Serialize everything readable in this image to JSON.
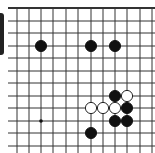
{
  "board": {
    "x_lines": [
      17,
      29,
      41,
      53,
      66,
      78,
      91,
      103,
      115,
      127,
      140,
      152
    ],
    "y_lines": [
      8,
      21,
      33,
      46,
      58,
      71,
      83,
      96,
      108,
      121,
      133,
      146
    ],
    "top_edge_y": 8,
    "line_color": "#333333",
    "stone_radius": 5.6,
    "star_points": [
      {
        "col": 2,
        "row": 9
      }
    ],
    "stones": [
      {
        "color": "black",
        "col": 2,
        "row": 3
      },
      {
        "color": "black",
        "col": 6,
        "row": 3
      },
      {
        "color": "black",
        "col": 8,
        "row": 3
      },
      {
        "color": "black",
        "col": 8,
        "row": 7
      },
      {
        "color": "white",
        "col": 9,
        "row": 7
      },
      {
        "color": "white",
        "col": 6,
        "row": 8
      },
      {
        "color": "white",
        "col": 7,
        "row": 8
      },
      {
        "color": "white",
        "col": 8,
        "row": 8
      },
      {
        "color": "black",
        "col": 9,
        "row": 8
      },
      {
        "color": "black",
        "col": 8,
        "row": 9
      },
      {
        "color": "black",
        "col": 9,
        "row": 9
      },
      {
        "color": "black",
        "col": 6,
        "row": 10
      }
    ]
  }
}
